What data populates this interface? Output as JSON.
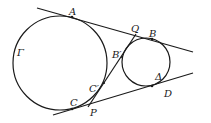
{
  "diagram": {
    "circles": [
      {
        "name": "Gamma",
        "label": "Γ",
        "cx": 60,
        "cy": 63,
        "r": 47
      },
      {
        "name": "Delta",
        "label": "Δ",
        "cx": 146,
        "cy": 62,
        "r": 24
      }
    ],
    "points": {
      "A": {
        "label": "A",
        "x": 72,
        "y": 17
      },
      "B": {
        "label": "B",
        "x": 152,
        "y": 39
      },
      "Q": {
        "label": "Q",
        "x": 134,
        "y": 34
      },
      "B_prime": {
        "label": "B′",
        "x": 123,
        "y": 58
      },
      "C_prime": {
        "label": "C′",
        "x": 103,
        "y": 90
      },
      "C": {
        "label": "C",
        "x": 72,
        "y": 109
      },
      "P": {
        "label": "P",
        "x": 89,
        "y": 105
      },
      "D": {
        "label": "D",
        "x": 152,
        "y": 86
      }
    },
    "labels": {
      "A": "A",
      "B": "B",
      "Q": "Q",
      "B_prime": "B′",
      "C_prime": "C′",
      "C": "C",
      "P": "P",
      "D": "D",
      "Gamma": "Γ",
      "Delta": "Δ"
    }
  }
}
